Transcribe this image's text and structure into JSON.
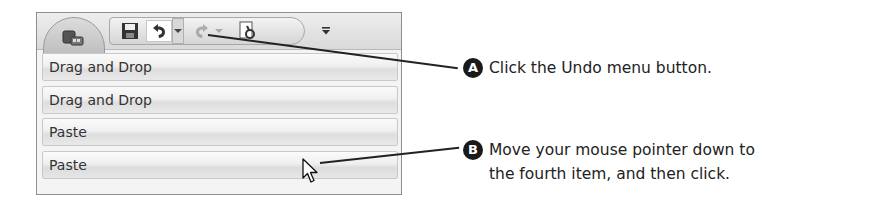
{
  "toolbar": {
    "office_button": "office-button",
    "buttons": [
      {
        "name": "save",
        "icon": "save-icon"
      },
      {
        "name": "undo",
        "icon": "undo-icon"
      },
      {
        "name": "undo-menu",
        "icon": "chevron-down-icon"
      },
      {
        "name": "redo",
        "icon": "redo-icon",
        "disabled": true
      },
      {
        "name": "redo-menu",
        "icon": "chevron-down-icon",
        "disabled": true
      },
      {
        "name": "print-preview",
        "icon": "print-preview-icon"
      },
      {
        "name": "customize",
        "icon": "customize-dropdown-icon"
      }
    ]
  },
  "undo_menu": {
    "items": [
      {
        "label": "Drag and Drop"
      },
      {
        "label": "Drag and Drop"
      },
      {
        "label": "Paste"
      },
      {
        "label": "Paste"
      }
    ]
  },
  "callouts": [
    {
      "badge": "A",
      "text": "Click the Undo menu button."
    },
    {
      "badge": "B",
      "text_line1": "Move your mouse pointer down to",
      "text_line2": "the fourth item, and then click."
    }
  ],
  "colors": {
    "leader_line": "#222222",
    "badge_bg": "#1a1a1a",
    "frame_border": "#8e8e8e"
  }
}
